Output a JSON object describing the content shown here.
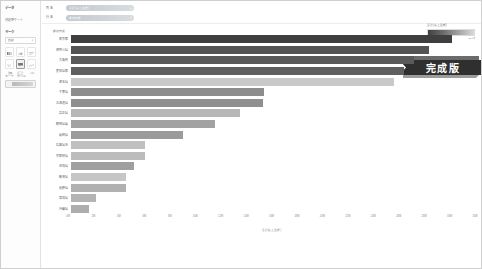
{
  "window": {
    "title": "完成版ダッシュボード"
  },
  "sidebar": {
    "header": "データ",
    "measures_label": "測定値ケート",
    "marks_label": "マーク",
    "mark_type": {
      "label": "自動",
      "value": "自動"
    },
    "mark_options": [
      {
        "name": "color",
        "label": "色"
      },
      {
        "name": "size",
        "label": "サイズ"
      },
      {
        "name": "label",
        "label": "ラベル"
      },
      {
        "name": "detail",
        "label": "詳細"
      },
      {
        "name": "tooltip",
        "label": "ツールヒント"
      },
      {
        "name": "path",
        "label": "パス"
      }
    ],
    "footer_labels": [
      "マーク",
      "ラベル"
    ],
    "pill_label": "合計(売上金額)"
  },
  "topbar": {
    "filters": [
      {
        "label": "列 名",
        "value": "合計(売上金額)"
      },
      {
        "label": "行 名",
        "value": "都道府県"
      }
    ]
  },
  "legend": {
    "title": "合計(売上金額)",
    "min": "0.0万",
    "max": "32.0万"
  },
  "badge": {
    "text": "完成版"
  },
  "chart_data": {
    "type": "bar",
    "orientation": "horizontal",
    "title": "都道府県",
    "xlabel": "合計(売上金額)",
    "ylabel": "",
    "xlim": [
      0,
      32
    ],
    "x_unit": "M",
    "grid": false,
    "legend_position": "top-right",
    "ticks": [
      "0M",
      "2M",
      "4M",
      "6M",
      "8M",
      "10M",
      "12M",
      "14M",
      "16M",
      "18M",
      "20M",
      "22M",
      "24M",
      "26M",
      "28M",
      "30M",
      "32M"
    ],
    "categories": [
      "東京都",
      "神奈川県",
      "大阪府",
      "愛知県都",
      "埼玉県",
      "千葉県",
      "北海道県",
      "兵庫県",
      "静岡県福",
      "福岡県",
      "広島県市",
      "京都府県",
      "茨城県",
      "新潟県",
      "長野県",
      "宮城県",
      "沖縄県"
    ],
    "values": [
      30.2,
      28.4,
      27.2,
      26.4,
      25.6,
      15.3,
      15.2,
      13.4,
      11.4,
      8.9,
      5.9,
      5.9,
      5.0,
      4.4,
      4.4,
      2.0,
      1.5
    ],
    "colors": [
      "#3f3f3f",
      "#545454",
      "#5a5a5a",
      "#5f5f5f",
      "#c9c9c9",
      "#8d8d8d",
      "#8f8f8f",
      "#b7b7b7",
      "#a2a2a2",
      "#9b9b9b",
      "#c0c0c0",
      "#bcbcbc",
      "#9f9f9f",
      "#c6c6c6",
      "#b1b1b1",
      "#b4b4b4",
      "#adadad"
    ]
  }
}
